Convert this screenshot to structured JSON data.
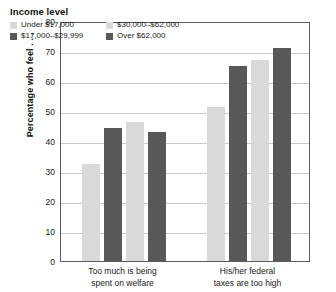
{
  "chart_data": {
    "type": "bar",
    "title": "",
    "subtitle": "",
    "xlabel": "",
    "ylabel": "Percentage who feel . . .",
    "ylim": [
      0,
      80
    ],
    "yticks": [
      0,
      10,
      20,
      30,
      40,
      50,
      60,
      70,
      80
    ],
    "ytick_labels": [
      "0",
      "10",
      "20",
      "30",
      "40",
      "50",
      "60",
      "70",
      "80"
    ],
    "grid": "horizontal",
    "legend_position": "inside-top-left",
    "legend_title": "Income level",
    "categories": [
      "Too much is being spent on welfare",
      "His/her federal taxes are too high"
    ],
    "category_lines": [
      [
        "Too much is being",
        "spent on welfare"
      ],
      [
        "His/her federal",
        "taxes are too high"
      ]
    ],
    "series": [
      {
        "name": "Under $17,000",
        "color": "#d9d9d9",
        "values": [
          32.5,
          51.5
        ]
      },
      {
        "name": "$17,000–$29,999",
        "color": "#585858",
        "values": [
          44.5,
          65.0
        ]
      },
      {
        "name": "$30,000–$62,000",
        "color": "#d9d9d9",
        "values": [
          46.5,
          67.0
        ]
      },
      {
        "name": "Over $62,000",
        "color": "#585858",
        "values": [
          43.0,
          71.0
        ]
      }
    ]
  },
  "colors": {
    "light_gray": "#d9d9d9",
    "dark_gray": "#585858",
    "gridline": "#c9c9c9",
    "axis_border": "#5b5b5b",
    "text": "#1a1a1a",
    "background": "#ffffff"
  }
}
